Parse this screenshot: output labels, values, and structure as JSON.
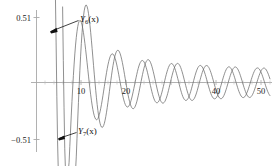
{
  "chart_data": {
    "type": "line",
    "title": "",
    "subtitle": "",
    "xlabel": "",
    "ylabel": "",
    "xlim": [
      0,
      52
    ],
    "ylim": [
      -0.51,
      0.51
    ],
    "grid": false,
    "legend_position": "inline-annotations",
    "background_color": "#ffffff",
    "axis_color": "#9a9a9a",
    "x_ticks": [
      {
        "value": 10,
        "label": "10"
      },
      {
        "value": 20,
        "label": "20"
      },
      {
        "value": 40,
        "label": "40"
      },
      {
        "value": 50,
        "label": "50"
      }
    ],
    "y_ticks": [
      {
        "value": 0.51,
        "label": "0.51"
      },
      {
        "value": -0.51,
        "label": "−0.51"
      }
    ],
    "annotations": [
      {
        "id": "label-y6",
        "base": "Y",
        "subscript": "6",
        "argument": "(x)",
        "text": "Y₆(x)",
        "target_x": 7.8,
        "target_y": 0.43
      },
      {
        "id": "label-y7",
        "base": "Y",
        "subscript": "7",
        "argument": "(x)",
        "text": "Y₇(x)",
        "target_x": 9.6,
        "target_y": -0.47
      }
    ],
    "series": [
      {
        "name": "Y6(x)",
        "order": 6,
        "color": "#6b6b6b",
        "line_width": 0.7,
        "description": "Bessel function of the second kind, order 6"
      },
      {
        "name": "Y7(x)",
        "order": 7,
        "color": "#6b6b6b",
        "line_width": 0.7,
        "description": "Bessel function of the second kind, order 7"
      }
    ]
  }
}
